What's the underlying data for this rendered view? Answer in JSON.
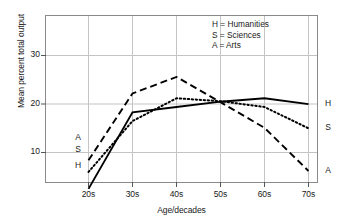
{
  "chart_data": {
    "type": "line",
    "title": "",
    "xlabel": "Age/decades",
    "ylabel": "Mean percent total output",
    "categories": [
      "20s",
      "30s",
      "40s",
      "50s",
      "60s",
      "70s"
    ],
    "xlim": [
      15,
      75
    ],
    "ylim": [
      0,
      35.5
    ],
    "yticks": [
      10,
      20,
      30
    ],
    "ytick_labels": [
      "10",
      "20",
      "30"
    ],
    "xticks": [
      "20s",
      "30s",
      "40s",
      "50s",
      "60s",
      "70s"
    ],
    "grid": true,
    "legend_position": "top-right",
    "series": [
      {
        "name": "Humanities",
        "key": "H",
        "style": "solid",
        "values": [
          2.5,
          18.3,
          19.4,
          20.5,
          21.2,
          20.0
        ]
      },
      {
        "name": "Sciences",
        "key": "S",
        "style": "dotted",
        "values": [
          6.0,
          16.5,
          21.2,
          20.6,
          19.4,
          15.0
        ]
      },
      {
        "name": "Arts",
        "key": "A",
        "style": "dashed",
        "values": [
          8.4,
          22.2,
          25.6,
          20.4,
          15.1,
          6.2
        ]
      }
    ]
  },
  "legend": {
    "entries": [
      "H = Humanities",
      "S = Sciences",
      "A = Arts"
    ]
  },
  "left_labels": [
    {
      "key": "A",
      "value": 8.4
    },
    {
      "key": "S",
      "value": 6.0
    },
    {
      "key": "H",
      "value": 2.5
    }
  ],
  "right_labels": [
    {
      "key": "H",
      "value": 20.0
    },
    {
      "key": "S",
      "value": 15.0
    },
    {
      "key": "A",
      "value": 6.2
    }
  ],
  "colors": {
    "line": "#000000",
    "grid": "#bbbbbb",
    "frame": "#8a8a8a",
    "text": "#1a1a1a",
    "background": "#ffffff"
  }
}
